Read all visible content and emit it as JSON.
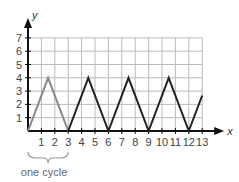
{
  "chart_data": {
    "type": "line",
    "title": "",
    "xlabel": "x",
    "ylabel": "y",
    "xlim": [
      0,
      13
    ],
    "ylim": [
      0,
      7
    ],
    "x_ticks": [
      1,
      2,
      3,
      4,
      5,
      6,
      7,
      8,
      9,
      10,
      11,
      12,
      13
    ],
    "y_ticks": [
      1,
      2,
      3,
      4,
      5,
      6,
      7
    ],
    "grid": true,
    "series": [
      {
        "name": "periodic triangle wave",
        "x": [
          0,
          1.5,
          3,
          4.5,
          6,
          7.5,
          9,
          10.5,
          12,
          13
        ],
        "values": [
          0,
          4,
          0,
          4,
          0,
          4,
          0,
          4,
          0,
          2.67
        ]
      }
    ],
    "highlight": {
      "label": "one cycle",
      "x_range": [
        0,
        3
      ],
      "color": "#888888"
    },
    "colors": {
      "curve": "#222222",
      "cycle": "#888888",
      "grid": "#bbbbbb",
      "axis": "#111111"
    }
  },
  "labels": {
    "x_axis": "x",
    "y_axis": "y",
    "cycle_note": "one cycle",
    "x_ticks": [
      "1",
      "2",
      "3",
      "4",
      "5",
      "6",
      "7",
      "8",
      "9",
      "10",
      "11",
      "12",
      "13"
    ],
    "y_ticks": [
      "1",
      "2",
      "3",
      "4",
      "5",
      "6",
      "7"
    ]
  }
}
